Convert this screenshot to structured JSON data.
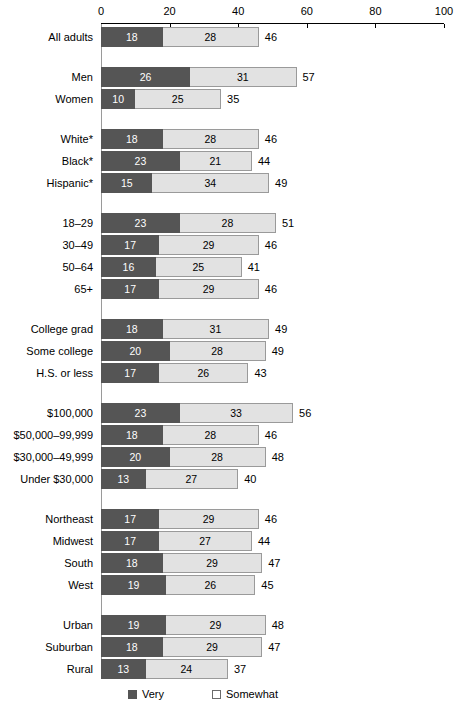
{
  "chart_data": {
    "type": "bar",
    "subtype": "stacked-horizontal",
    "title": "",
    "xlabel": "",
    "ylabel": "",
    "xlim": [
      0,
      100
    ],
    "xticks": [
      0,
      20,
      40,
      60,
      80,
      100
    ],
    "grid": false,
    "legend_position": "bottom",
    "legend": [
      "Very",
      "Somewhat"
    ],
    "series": [
      {
        "name": "Very",
        "color": "#555555",
        "values": [
          18,
          26,
          10,
          18,
          23,
          15,
          23,
          17,
          16,
          17,
          18,
          20,
          17,
          23,
          18,
          20,
          13,
          17,
          17,
          18,
          19,
          19,
          18,
          13
        ]
      },
      {
        "name": "Somewhat",
        "color": "#e2e2e2",
        "values": [
          28,
          31,
          25,
          28,
          21,
          34,
          28,
          29,
          25,
          29,
          31,
          28,
          26,
          33,
          28,
          28,
          27,
          29,
          27,
          29,
          26,
          29,
          29,
          24
        ]
      }
    ],
    "categories": [
      "All adults",
      "Men",
      "Women",
      "White*",
      "Black*",
      "Hispanic*",
      "18–29",
      "30–49",
      "50–64",
      "65+",
      "College grad",
      "Some college",
      "H.S. or less",
      "$100,000",
      "$50,000–99,999",
      "$30,000–49,999",
      "Under $30,000",
      "Northeast",
      "Midwest",
      "South",
      "West",
      "Urban",
      "Suburban",
      "Rural"
    ],
    "totals": [
      46,
      57,
      35,
      46,
      44,
      49,
      51,
      46,
      41,
      46,
      49,
      49,
      43,
      56,
      46,
      48,
      40,
      46,
      44,
      47,
      45,
      48,
      47,
      37
    ]
  },
  "axis": {
    "ticks": [
      {
        "label": "0",
        "value": 0
      },
      {
        "label": "20",
        "value": 20
      },
      {
        "label": "40",
        "value": 40
      },
      {
        "label": "60",
        "value": 60
      },
      {
        "label": "80",
        "value": 80
      },
      {
        "label": "100",
        "value": 100
      }
    ]
  },
  "groups": [
    {
      "name": "all-adults",
      "rows": [
        {
          "label": "All adults",
          "very": 18,
          "somewhat": 28,
          "total": 46
        }
      ]
    },
    {
      "name": "gender",
      "rows": [
        {
          "label": "Men",
          "very": 26,
          "somewhat": 31,
          "total": 57
        },
        {
          "label": "Women",
          "very": 10,
          "somewhat": 25,
          "total": 35
        }
      ]
    },
    {
      "name": "race-ethnicity",
      "rows": [
        {
          "label": "White*",
          "very": 18,
          "somewhat": 28,
          "total": 46
        },
        {
          "label": "Black*",
          "very": 23,
          "somewhat": 21,
          "total": 44
        },
        {
          "label": "Hispanic*",
          "very": 15,
          "somewhat": 34,
          "total": 49
        }
      ]
    },
    {
      "name": "age",
      "rows": [
        {
          "label": "18–29",
          "very": 23,
          "somewhat": 28,
          "total": 51
        },
        {
          "label": "30–49",
          "very": 17,
          "somewhat": 29,
          "total": 46
        },
        {
          "label": "50–64",
          "very": 16,
          "somewhat": 25,
          "total": 41
        },
        {
          "label": "65+",
          "very": 17,
          "somewhat": 29,
          "total": 46
        }
      ]
    },
    {
      "name": "education",
      "rows": [
        {
          "label": "College grad",
          "very": 18,
          "somewhat": 31,
          "total": 49
        },
        {
          "label": "Some college",
          "very": 20,
          "somewhat": 28,
          "total": 49
        },
        {
          "label": "H.S. or less",
          "very": 17,
          "somewhat": 26,
          "total": 43
        }
      ]
    },
    {
      "name": "income",
      "rows": [
        {
          "label": "$100,000",
          "very": 23,
          "somewhat": 33,
          "total": 56
        },
        {
          "label": "$50,000–99,999",
          "very": 18,
          "somewhat": 28,
          "total": 46
        },
        {
          "label": "$30,000–49,999",
          "very": 20,
          "somewhat": 28,
          "total": 48
        },
        {
          "label": "Under $30,000",
          "very": 13,
          "somewhat": 27,
          "total": 40
        }
      ]
    },
    {
      "name": "region",
      "rows": [
        {
          "label": "Northeast",
          "very": 17,
          "somewhat": 29,
          "total": 46
        },
        {
          "label": "Midwest",
          "very": 17,
          "somewhat": 27,
          "total": 44
        },
        {
          "label": "South",
          "very": 18,
          "somewhat": 29,
          "total": 47
        },
        {
          "label": "West",
          "very": 19,
          "somewhat": 26,
          "total": 45
        }
      ]
    },
    {
      "name": "community-type",
      "rows": [
        {
          "label": "Urban",
          "very": 19,
          "somewhat": 29,
          "total": 48
        },
        {
          "label": "Suburban",
          "very": 18,
          "somewhat": 29,
          "total": 47
        },
        {
          "label": "Rural",
          "very": 13,
          "somewhat": 24,
          "total": 37
        }
      ]
    }
  ],
  "legend": {
    "very_label": "Very",
    "somewhat_label": "Somewhat"
  },
  "colors": {
    "very": "#555555",
    "somewhat": "#e2e2e2",
    "somewhat_border": "#9a9a9a",
    "axis": "#000000",
    "baseline": "#9a9a9a"
  }
}
